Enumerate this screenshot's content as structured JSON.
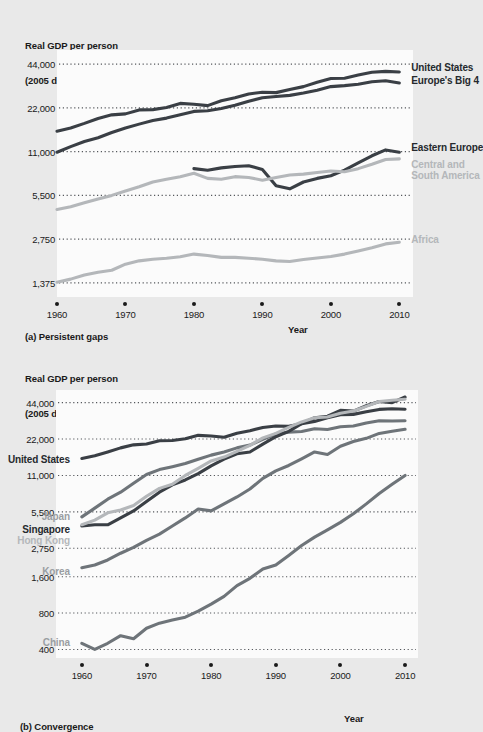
{
  "figure": {
    "background": "#e9e9e9",
    "plot_background": "#fbfbfb",
    "dark_color": "#3a3f45",
    "mid_color": "#6e7479",
    "light_color": "#b4b7ba"
  },
  "panel_a": {
    "axis_title_line1": "Real GDP per person",
    "axis_title_line2": "(2005 dollars: ratio scale)",
    "caption": "(a) Persistent gaps",
    "xaxis_name": "Year"
  },
  "panel_b": {
    "axis_title_line1": "Real GDP per person",
    "axis_title_line2": "(2005 dollars: ratio scale)",
    "caption": "(b) Convergence",
    "xaxis_name": "Year"
  },
  "chart_data": [
    {
      "id": "a",
      "type": "line",
      "title": "(a) Persistent gaps",
      "ylabel": "Real GDP per person (2005 dollars: ratio scale)",
      "xlabel": "Year",
      "scale": "log",
      "grid": true,
      "legend_position": "inline-right",
      "xlim": [
        1960,
        2012
      ],
      "xticks": [
        1960,
        1970,
        1980,
        1990,
        2000,
        2010
      ],
      "xtick_labels": [
        "1960",
        "1970",
        "1980",
        "1990",
        "2000",
        "2010"
      ],
      "ylim": [
        1100,
        55000
      ],
      "yticks": [
        1375,
        2750,
        5500,
        11000,
        22000,
        44000
      ],
      "ytick_labels": [
        "1,375",
        "2,750",
        "5,500",
        "11,000",
        "22,000",
        "44,000"
      ],
      "series": [
        {
          "name": "United States",
          "color": "#3a3f45",
          "label_side": "right",
          "x": [
            1960,
            1962,
            1964,
            1966,
            1968,
            1970,
            1972,
            1974,
            1976,
            1978,
            1980,
            1982,
            1984,
            1986,
            1988,
            1990,
            1992,
            1994,
            1996,
            1998,
            2000,
            2002,
            2004,
            2006,
            2008,
            2010
          ],
          "y": [
            15200,
            16000,
            17200,
            18600,
            19700,
            20000,
            21300,
            21400,
            22100,
            23600,
            23300,
            22800,
            24600,
            25800,
            27400,
            28200,
            28000,
            29400,
            30800,
            33000,
            35000,
            35200,
            37000,
            38700,
            39200,
            38800
          ]
        },
        {
          "name": "Europe's Big 4",
          "color": "#3a3f45",
          "label_side": "right",
          "x": [
            1960,
            1962,
            1964,
            1966,
            1968,
            1970,
            1972,
            1974,
            1976,
            1978,
            1980,
            1982,
            1984,
            1986,
            1988,
            1990,
            1992,
            1994,
            1996,
            1998,
            2000,
            2002,
            2004,
            2006,
            2008,
            2010
          ],
          "y": [
            10900,
            11900,
            12900,
            13700,
            14900,
            16000,
            17000,
            18000,
            18700,
            19700,
            20800,
            21000,
            21800,
            22900,
            24400,
            25800,
            26300,
            26800,
            27800,
            29100,
            30800,
            31300,
            32000,
            33300,
            33800,
            32600
          ]
        },
        {
          "name": "Eastern Europe",
          "color": "#3a3f45",
          "label_side": "right",
          "x": [
            1980,
            1982,
            1984,
            1986,
            1988,
            1990,
            1992,
            1994,
            1996,
            1998,
            2000,
            2002,
            2004,
            2006,
            2008,
            2010
          ],
          "y": [
            8400,
            8200,
            8500,
            8700,
            8800,
            8300,
            6400,
            6100,
            6800,
            7200,
            7500,
            8200,
            9200,
            10300,
            11300,
            10900
          ]
        },
        {
          "name": "Central and\nSouth America",
          "color": "#b4b7ba",
          "label_side": "right",
          "x": [
            1960,
            1962,
            1964,
            1966,
            1968,
            1970,
            1972,
            1974,
            1976,
            1978,
            1980,
            1982,
            1984,
            1986,
            1988,
            1990,
            1992,
            1994,
            1996,
            1998,
            2000,
            2002,
            2004,
            2006,
            2008,
            2010
          ],
          "y": [
            4400,
            4600,
            4900,
            5200,
            5500,
            5900,
            6300,
            6800,
            7100,
            7400,
            7800,
            7200,
            7100,
            7400,
            7300,
            7000,
            7300,
            7600,
            7700,
            7900,
            8100,
            8000,
            8400,
            9000,
            9700,
            9800
          ]
        },
        {
          "name": "Africa",
          "color": "#b4b7ba",
          "label_side": "right",
          "x": [
            1960,
            1962,
            1964,
            1966,
            1968,
            1970,
            1972,
            1974,
            1976,
            1978,
            1980,
            1982,
            1984,
            1986,
            1988,
            1990,
            1992,
            1994,
            1996,
            1998,
            2000,
            2002,
            2004,
            2006,
            2008,
            2010
          ],
          "y": [
            1390,
            1460,
            1560,
            1630,
            1680,
            1850,
            1950,
            2000,
            2030,
            2080,
            2170,
            2120,
            2060,
            2060,
            2030,
            2000,
            1950,
            1930,
            1990,
            2040,
            2090,
            2170,
            2280,
            2400,
            2550,
            2620
          ]
        }
      ]
    },
    {
      "id": "b",
      "type": "line",
      "title": "(b) Convergence",
      "ylabel": "Real GDP per person (2005 dollars: ratio scale)",
      "xlabel": "Year",
      "scale": "log",
      "grid": true,
      "legend_position": "inline-left",
      "xlim": [
        1956,
        2012
      ],
      "xticks": [
        1960,
        1970,
        1980,
        1990,
        2000,
        2010
      ],
      "xtick_labels": [
        "1960",
        "1970",
        "1980",
        "1990",
        "2000",
        "2010"
      ],
      "ylim": [
        340,
        56000
      ],
      "yticks": [
        400,
        800,
        1600,
        2750,
        5500,
        11000,
        22000,
        44000
      ],
      "ytick_labels": [
        "400",
        "800",
        "1,600",
        "2,750",
        "5,500",
        "11,000",
        "22,000",
        "44,000"
      ],
      "series": [
        {
          "name": "United States",
          "color": "#3a3f45",
          "label_side": "left",
          "x": [
            1960,
            1962,
            1964,
            1966,
            1968,
            1970,
            1972,
            1974,
            1976,
            1978,
            1980,
            1982,
            1984,
            1986,
            1988,
            1990,
            1992,
            1994,
            1996,
            1998,
            2000,
            2002,
            2004,
            2006,
            2008,
            2010
          ],
          "y": [
            15200,
            16000,
            17200,
            18600,
            19700,
            20000,
            21300,
            21400,
            22100,
            23600,
            23300,
            22800,
            24600,
            25800,
            27400,
            28200,
            28000,
            29400,
            30800,
            33000,
            35000,
            35200,
            37000,
            38700,
            39200,
            38800
          ]
        },
        {
          "name": "Japan",
          "color": "#6e7479",
          "label_side": "left",
          "x": [
            1960,
            1962,
            1964,
            1966,
            1968,
            1970,
            1972,
            1974,
            1976,
            1978,
            1980,
            1982,
            1984,
            1986,
            1988,
            1990,
            1992,
            1994,
            1996,
            1998,
            2000,
            2002,
            2004,
            2006,
            2008,
            2010
          ],
          "y": [
            5000,
            5900,
            7000,
            8000,
            9500,
            11200,
            12300,
            13000,
            13800,
            15000,
            16200,
            17200,
            18600,
            19600,
            21900,
            24200,
            25100,
            25400,
            26800,
            26400,
            27800,
            28200,
            29900,
            31200,
            31000,
            31200
          ]
        },
        {
          "name": "Singapore",
          "color": "#3a3f45",
          "label_side": "left",
          "x": [
            1960,
            1962,
            1964,
            1966,
            1968,
            1970,
            1972,
            1974,
            1976,
            1978,
            1980,
            1982,
            1984,
            1986,
            1988,
            1990,
            1992,
            1994,
            1996,
            1998,
            2000,
            2002,
            2004,
            2006,
            2008,
            2010
          ],
          "y": [
            4200,
            4300,
            4300,
            4900,
            5600,
            6700,
            8000,
            9200,
            10100,
            11400,
            13200,
            15000,
            16600,
            17200,
            20000,
            23000,
            25500,
            29500,
            33000,
            34000,
            38000,
            37500,
            41500,
            45000,
            44000,
            49000
          ]
        },
        {
          "name": "Hong Kong",
          "color": "#b4b7ba",
          "label_side": "left",
          "x": [
            1960,
            1962,
            1964,
            1966,
            1968,
            1970,
            1972,
            1974,
            1976,
            1978,
            1980,
            1982,
            1984,
            1986,
            1988,
            1990,
            1992,
            1994,
            1996,
            1998,
            2000,
            2002,
            2004,
            2006,
            2008,
            2010
          ],
          "y": [
            4300,
            4700,
            5400,
            5700,
            6200,
            7400,
            8600,
            9300,
            11000,
            12600,
            14500,
            15600,
            17400,
            19500,
            22500,
            24500,
            27500,
            30500,
            33000,
            33500,
            36000,
            37500,
            41000,
            45000,
            46000,
            47000
          ]
        },
        {
          "name": "Korea",
          "color": "#6e7479",
          "label_side": "left",
          "x": [
            1960,
            1962,
            1964,
            1966,
            1968,
            1970,
            1972,
            1974,
            1976,
            1978,
            1980,
            1982,
            1984,
            1986,
            1988,
            1990,
            1992,
            1994,
            1996,
            1998,
            2000,
            2002,
            2004,
            2006,
            2008,
            2010
          ],
          "y": [
            1900,
            2000,
            2200,
            2500,
            2800,
            3200,
            3600,
            4200,
            4900,
            5800,
            5600,
            6400,
            7300,
            8500,
            10400,
            12000,
            13300,
            15100,
            17200,
            16400,
            19200,
            21000,
            22300,
            24500,
            25500,
            26500
          ]
        },
        {
          "name": "China",
          "color": "#6e7479",
          "label_side": "left",
          "x": [
            1960,
            1962,
            1964,
            1966,
            1968,
            1970,
            1972,
            1974,
            1976,
            1978,
            1980,
            1982,
            1984,
            1986,
            1988,
            1990,
            1992,
            1994,
            1996,
            1998,
            2000,
            2002,
            2004,
            2006,
            2008,
            2010
          ],
          "y": [
            450,
            400,
            450,
            520,
            490,
            600,
            660,
            700,
            740,
            830,
            950,
            1100,
            1350,
            1550,
            1850,
            2000,
            2400,
            2900,
            3400,
            3900,
            4500,
            5300,
            6400,
            7800,
            9300,
            11000
          ]
        }
      ]
    }
  ]
}
